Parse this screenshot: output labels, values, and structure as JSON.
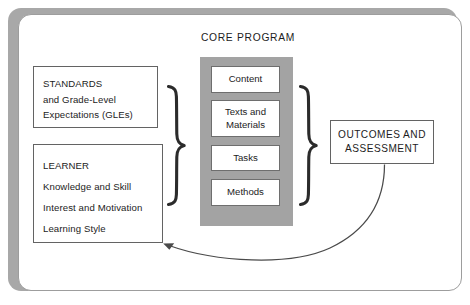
{
  "diagram": {
    "title_center": "CORE PROGRAM",
    "left_boxes": [
      {
        "id": "standards",
        "lines": [
          "STANDARDS",
          "and Grade-Level",
          "Expectations (GLEs)"
        ]
      },
      {
        "id": "learner",
        "lines": [
          "LEARNER",
          "Knowledge and Skill",
          "Interest and Motivation",
          "Learning Style"
        ]
      }
    ],
    "core_items": [
      {
        "label": "Content"
      },
      {
        "label": "Texts and\nMaterials"
      },
      {
        "label": "Tasks"
      },
      {
        "label": "Methods"
      }
    ],
    "right_box": {
      "id": "outcomes",
      "lines": [
        "OUTCOMES AND",
        "ASSESSMENT"
      ]
    },
    "connectors": {
      "left_brace": "right-pointing-curly-brace",
      "right_brace": "right-pointing-curly-brace",
      "feedback_arrow": "curved-arrow-outcomes-to-learner"
    },
    "colors": {
      "core_column_fill": "#a3a3a3",
      "box_border": "#636363",
      "card_border": "#9d9d9d",
      "shadow": "#a8a8a8",
      "text": "#1c1c1c",
      "stroke": "#2b2b2b"
    }
  }
}
